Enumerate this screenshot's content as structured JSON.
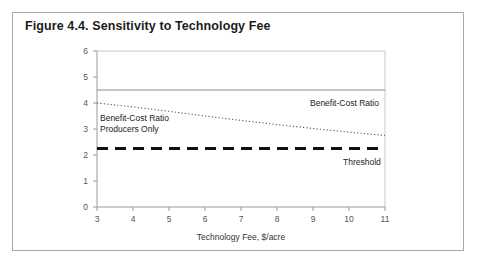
{
  "figure": {
    "title": "Figure 4.4. Sensitivity to Technology Fee",
    "frame_color": "#a9a9a9",
    "background": "#ffffff"
  },
  "chart_data": {
    "type": "line",
    "title": "Figure 4.4. Sensitivity to Technology Fee",
    "xlabel": "Technology Fee, $/acre",
    "ylabel": "",
    "xlim": [
      3,
      11
    ],
    "ylim": [
      0,
      6
    ],
    "xticks": [
      3,
      4,
      5,
      6,
      7,
      8,
      9,
      10,
      11
    ],
    "yticks": [
      0,
      1,
      2,
      3,
      4,
      5,
      6
    ],
    "xtick_labels": [
      "3",
      "4",
      "5",
      "6",
      "7",
      "8",
      "9",
      "10",
      "11"
    ],
    "ytick_labels": [
      "0",
      "1",
      "2",
      "3",
      "4",
      "5",
      "6"
    ],
    "grid": false,
    "legend_position": "inline-annotations",
    "x": [
      3,
      4,
      5,
      6,
      7,
      8,
      9,
      10,
      11
    ],
    "series": [
      {
        "name": "Benefit-Cost Ratio",
        "style": "solid",
        "color": "#8c8c8c",
        "width": 1.2,
        "values": [
          4.5,
          4.5,
          4.5,
          4.5,
          4.5,
          4.5,
          4.5,
          4.5,
          4.5
        ],
        "annotation": {
          "text": "Benefit-Cost Ratio",
          "x": 9.0,
          "y": 4.05
        }
      },
      {
        "name": "Benefit-Cost Ratio Producers Only",
        "style": "dotted",
        "color": "#555555",
        "width": 1.1,
        "values": [
          4.0,
          3.85,
          3.68,
          3.5,
          3.33,
          3.17,
          3.02,
          2.88,
          2.75
        ],
        "annotation": {
          "line1": "Benefit-Cost Ratio",
          "line2": "Producers Only",
          "x": 3.1,
          "y": 3.45
        }
      },
      {
        "name": "Threshold",
        "style": "dashed",
        "color": "#111111",
        "width": 3.2,
        "values": [
          2.25,
          2.25,
          2.25,
          2.25,
          2.25,
          2.25,
          2.25,
          2.25,
          2.25
        ],
        "annotation": {
          "text": "Threshold",
          "x": 9.6,
          "y": 1.85
        }
      }
    ]
  },
  "axes": {
    "axis_color": "#9a9a9a",
    "tick_color": "#9a9a9a",
    "label_color": "#555555"
  }
}
